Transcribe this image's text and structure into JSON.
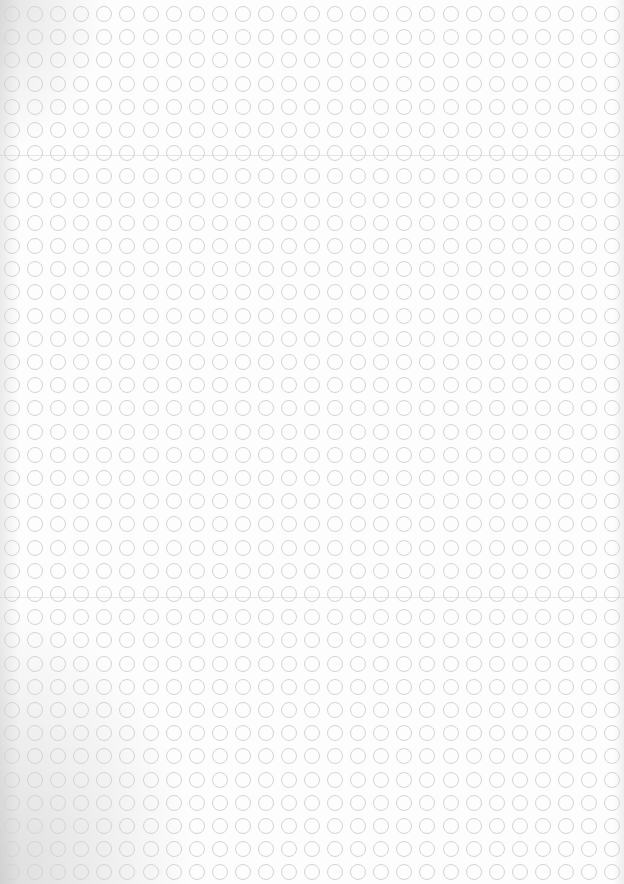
{
  "sheet": {
    "description": "Scanned blank dot-grid sheet of hollow circles",
    "grid": {
      "columns": 27,
      "rows": 38,
      "first_center_x": 12,
      "first_center_y": 14,
      "spacing_x": 23.08,
      "spacing_y": 23.2,
      "circle_diameter": 16
    },
    "colors": {
      "paper": "#fdfdfd",
      "circle_stroke": "#d4d4d4"
    },
    "fold_lines_y": [
      155,
      597
    ]
  }
}
